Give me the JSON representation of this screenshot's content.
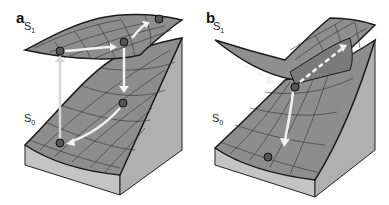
{
  "figure": {
    "panels": [
      {
        "id": "a",
        "label": "a",
        "upper_surface_label": "S",
        "upper_surface_sub": "1",
        "lower_surface_label": "S",
        "lower_surface_sub": "0",
        "description": "Excitation from S0 up to S1, relaxation along S1, vertical return to S0, relaxation along S0 back to start"
      },
      {
        "id": "b",
        "label": "b",
        "upper_surface_label": "S",
        "upper_surface_sub": "1",
        "lower_surface_label": "S",
        "lower_surface_sub": "0",
        "description": "Dashed path on S1 through conical intersection, funneling down S0"
      }
    ],
    "colors": {
      "surface_fill": "#8a8a8a",
      "surface_fill_light": "#9c9c9c",
      "block_side": "#c8c8c8",
      "block_front": "#b4b4b4",
      "grid_line": "#333333",
      "outline": "#1a1a1a",
      "arrow": "#f2f2f2",
      "arrow_vertical": "#d8d8d8",
      "ball": "#555555"
    }
  }
}
